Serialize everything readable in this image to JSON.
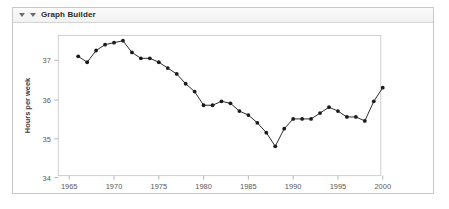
{
  "panel": {
    "title": "Graph Builder",
    "disclosure_icon": "triangle-down-icon",
    "collapse_icon": "triangle-down-icon"
  },
  "colors": {
    "line": "#2b2b2b",
    "marker": "#1a1a1a",
    "frame": "#cfcfcf",
    "tick_label": "#5a5a5a",
    "axis_title": "#3a3a3a",
    "panel_border": "#c9c9c9",
    "titlebar_bg": "#f1f1f1",
    "plot_bg": "#ffffff"
  },
  "chart_data": {
    "type": "line",
    "title": "",
    "xlabel": "Year",
    "ylabel": "Hours per week",
    "xlim": [
      1964.5,
      2001.5
    ],
    "ylim": [
      33.7,
      37.8
    ],
    "xticks": [
      1965,
      1970,
      1975,
      1980,
      1985,
      1990,
      1995,
      2000
    ],
    "yticks": [
      34,
      35,
      36,
      37
    ],
    "grid": false,
    "legend": null,
    "markers": "filled-circle",
    "x": [
      1966,
      1967,
      1968,
      1969,
      1970,
      1971,
      1972,
      1973,
      1974,
      1975,
      1976,
      1977,
      1978,
      1979,
      1980,
      1981,
      1982,
      1983,
      1984,
      1985,
      1986,
      1987,
      1988,
      1989,
      1990,
      1991,
      1992,
      1993,
      1994,
      1995,
      1996,
      1997,
      1998,
      1999,
      2000
    ],
    "values": [
      37.1,
      36.95,
      37.25,
      37.4,
      37.45,
      37.5,
      37.2,
      37.05,
      37.05,
      36.95,
      36.8,
      36.65,
      36.4,
      36.2,
      35.85,
      35.85,
      35.95,
      35.9,
      35.7,
      35.6,
      35.4,
      35.15,
      34.8,
      35.25,
      35.5,
      35.5,
      35.5,
      35.65,
      35.8,
      35.7,
      35.55,
      35.55,
      35.45,
      35.95,
      36.3
    ],
    "series": [
      {
        "name": "Hours per week",
        "values": [
          37.1,
          36.95,
          37.25,
          37.4,
          37.45,
          37.5,
          37.2,
          37.05,
          37.05,
          36.95,
          36.8,
          36.65,
          36.4,
          36.2,
          35.85,
          35.85,
          35.95,
          35.9,
          35.7,
          35.6,
          35.4,
          35.15,
          34.8,
          35.25,
          35.5,
          35.5,
          35.5,
          35.65,
          35.8,
          35.7,
          35.55,
          35.55,
          35.45,
          35.95,
          36.3
        ]
      }
    ]
  }
}
